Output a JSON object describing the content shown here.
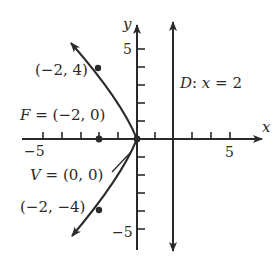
{
  "diagram": {
    "type": "parabola-graph",
    "equation_implied": "y^2 = -8x",
    "axes": {
      "x_label": "x",
      "y_label": "y",
      "x_tick_labels": [
        "−5",
        "5"
      ],
      "y_tick_labels": [
        "5",
        "−5"
      ],
      "x_range": [
        -5,
        5
      ],
      "y_range": [
        -5,
        5
      ]
    },
    "labels": {
      "focus": "F = (−2, 0)",
      "focus_prefix": "F",
      "focus_rest": " = (−2, 0)",
      "vertex": "V = (0, 0)",
      "vertex_prefix": "V",
      "vertex_rest": " = (0, 0)",
      "point_upper": "(−2, 4)",
      "point_lower": "(−2, −4)",
      "directrix": "D: x = 2",
      "directrix_prefix": "D",
      "directrix_colon": ": ",
      "directrix_var": "x",
      "directrix_rest": " = 2"
    },
    "points": [
      {
        "name": "focus",
        "x": -2,
        "y": 0
      },
      {
        "name": "vertex",
        "x": 0,
        "y": 0
      },
      {
        "name": "upper",
        "x": -2,
        "y": 4
      },
      {
        "name": "lower",
        "x": -2,
        "y": -4
      }
    ],
    "directrix_x": 2,
    "colors": {
      "ink": "#2a2a2a",
      "background": "#ffffff"
    }
  }
}
